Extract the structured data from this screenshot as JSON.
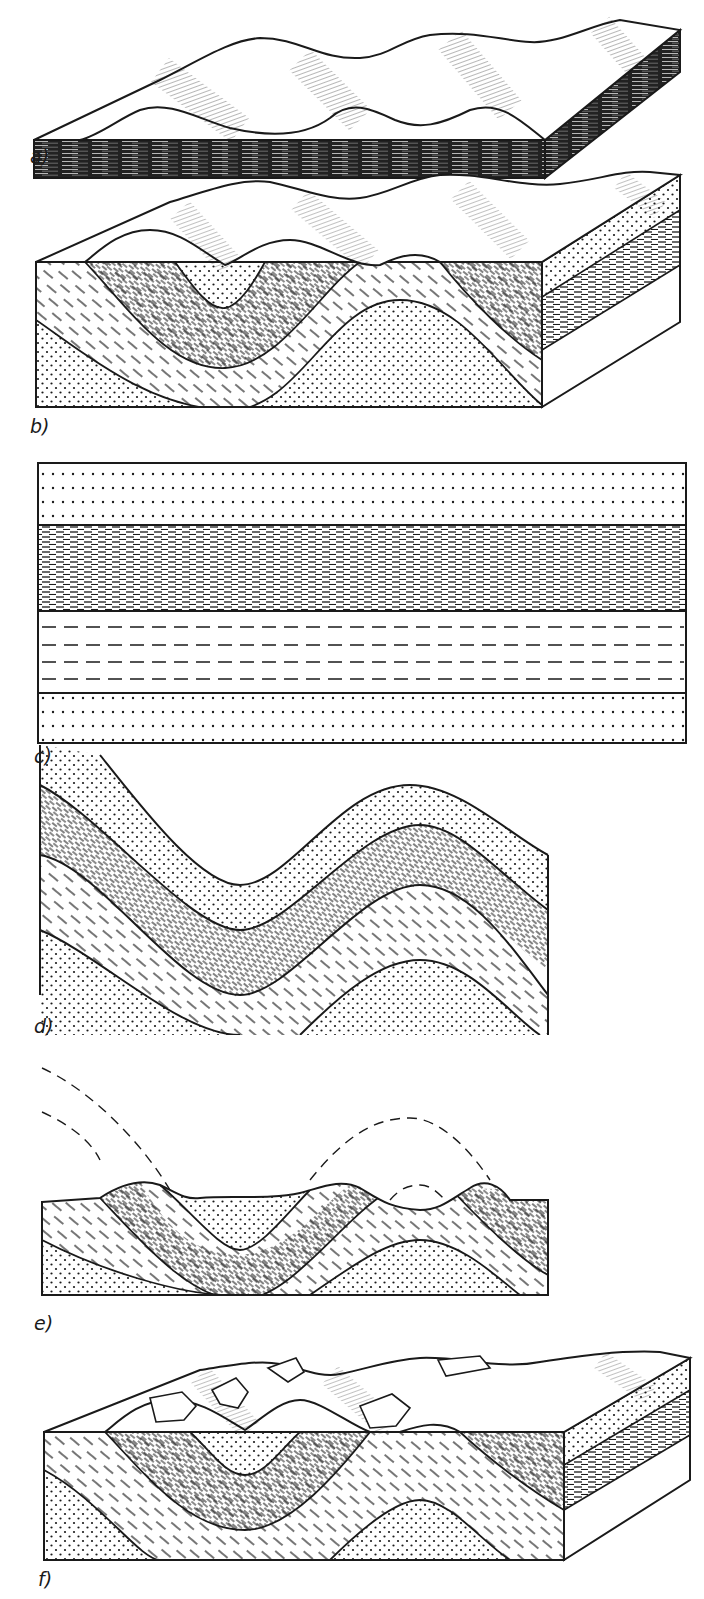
{
  "figure": {
    "ink_color": "#1a1a1a",
    "background": "#ffffff",
    "panels": [
      {
        "id": "a",
        "label": "a)",
        "type": "block-diagram",
        "content": "undulating dune-like surface over dark, finely laminated base slab"
      },
      {
        "id": "b",
        "label": "b)",
        "type": "block-diagram",
        "content": "folded strata (syncline/anticline) beneath eroded ridged surface"
      },
      {
        "id": "c",
        "label": "c)",
        "type": "cross-section",
        "content": "four horizontal layers: dotted sandstone, dense dashed shale, sparse dashed, dotted sandstone"
      },
      {
        "id": "d",
        "label": "d)",
        "type": "cross-section",
        "content": "same four layers folded into a syncline and anticline"
      },
      {
        "id": "e",
        "label": "e)",
        "type": "cross-section",
        "content": "eroded folded layers with dashed reconstruction of removed fold crests above surface"
      },
      {
        "id": "f",
        "label": "f)",
        "type": "block-diagram",
        "content": "eroded folded block with rock outcrops/tors on ridges"
      }
    ],
    "legend_patterns": {
      "sandstone": "dotted",
      "shale": "dense-dashes",
      "siltstone": "sparse-dashes"
    }
  }
}
